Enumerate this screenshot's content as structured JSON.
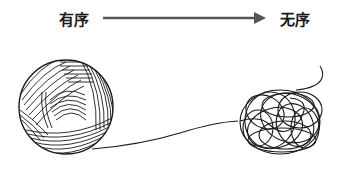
{
  "diagram": {
    "left_label": "有序",
    "right_label": "无序",
    "arrow_direction": "left-to-right",
    "left_image": "yarn-ball-ordered",
    "right_image": "tangled-yarn-disordered",
    "colors": {
      "text": "#1a1a1a",
      "arrow": "#555555",
      "line": "#1a1a1a",
      "background": "#ffffff"
    }
  }
}
